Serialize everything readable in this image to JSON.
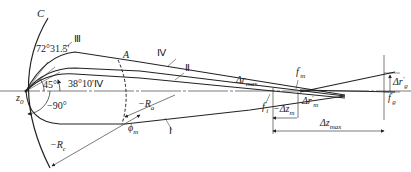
{
  "diagram": {
    "type": "optical-ray-trajectory-diagram",
    "stroke_color": "#222222",
    "labels": {
      "curve_c": "C",
      "angle_72": "72°31.5'",
      "curve_iii": "Ⅲ",
      "angle_45": "45°",
      "angle_38": "38°10'",
      "curve_iv_near": "Ⅳ",
      "curve_iv": "Ⅳ",
      "curve_ii": "Ⅱ",
      "curve_i": "Ⅰ",
      "point_a": "A",
      "origin_z0": "z",
      "origin_z0_sub": "0",
      "angle_neg90": "−90°",
      "radius_rc": "−R",
      "radius_rc_sub": "c",
      "radius_ra": "−R",
      "radius_ra_sub": "a",
      "phi_m": "ϕ",
      "phi_m_sub": "m",
      "delta_r_max": "Δr",
      "delta_r_max_sub": "max",
      "focus_fi": "f",
      "focus_fi_sub": "i",
      "focus_fm": "f",
      "focus_fm_sub": "m",
      "delta_z_m": "−Δz",
      "delta_z_m_sub": "m",
      "delta_r_m": "Δr",
      "delta_r_m_sub": "m",
      "delta_z_max": "Δz",
      "delta_z_max_sub": "max",
      "delta_r_g": "Δr",
      "delta_r_g_sub": "g",
      "focus_fg": "f",
      "focus_fg_sub": "g",
      "prime": "′"
    }
  }
}
